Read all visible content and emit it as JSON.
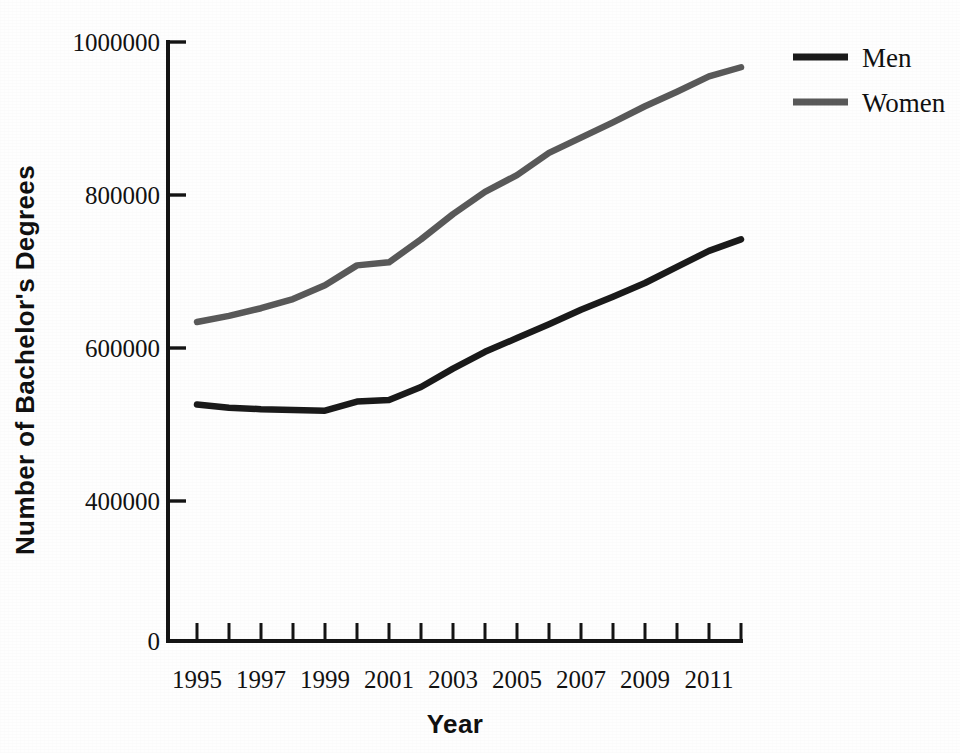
{
  "chart_data": {
    "type": "line",
    "title": "",
    "xlabel": "Year",
    "ylabel": "Number of Bachelor's Degrees",
    "x": [
      1995,
      1996,
      1997,
      1998,
      1999,
      2000,
      2001,
      2002,
      2003,
      2004,
      2005,
      2006,
      2007,
      2008,
      2009,
      2010,
      2011,
      2012
    ],
    "series": [
      {
        "name": "Men",
        "color": "#1a1a1a",
        "values": [
          526000,
          522000,
          520000,
          519000,
          518000,
          530000,
          532000,
          549000,
          573000,
          595000,
          613000,
          631000,
          650000,
          667000,
          685000,
          706000,
          727000,
          742000
        ]
      },
      {
        "name": "Women",
        "color": "#595959",
        "values": [
          634000,
          642000,
          652000,
          664000,
          682000,
          708000,
          712000,
          742000,
          775000,
          804000,
          826000,
          855000,
          875000,
          895000,
          916000,
          935000,
          955000,
          967000
        ]
      }
    ],
    "xlim": [
      1995,
      2012
    ],
    "ylim": [
      0,
      1000000
    ],
    "y_axis_break": true,
    "y_axis_note": "Axis is compressed between 0 and 400000 (no 200000 tick shown)",
    "yticks": [
      0,
      400000,
      600000,
      800000,
      1000000
    ],
    "ytick_labels": [
      "0",
      "400000",
      "600000",
      "800000",
      "1000000"
    ],
    "xticks": [
      1995,
      1996,
      1997,
      1998,
      1999,
      2000,
      2001,
      2002,
      2003,
      2004,
      2005,
      2006,
      2007,
      2008,
      2009,
      2010,
      2011,
      2012
    ],
    "xtick_labels_shown": [
      "1995",
      "1997",
      "1999",
      "2001",
      "2003",
      "2005",
      "2007",
      "2009",
      "2011"
    ],
    "grid": false,
    "legend_position": "top-right",
    "legend_entries": [
      "Men",
      "Women"
    ],
    "background_color": "#fefefe",
    "axis_color": "#141414"
  },
  "axes": {
    "y_title": "Number of Bachelor's Degrees",
    "x_title": "Year",
    "y_tick_0": "0",
    "y_tick_400k": "400000",
    "y_tick_600k": "600000",
    "y_tick_800k": "800000",
    "y_tick_1000k": "1000000",
    "x_tick_1995": "1995",
    "x_tick_1997": "1997",
    "x_tick_1999": "1999",
    "x_tick_2001": "2001",
    "x_tick_2003": "2003",
    "x_tick_2005": "2005",
    "x_tick_2007": "2007",
    "x_tick_2009": "2009",
    "x_tick_2011": "2011"
  },
  "legend": {
    "men_label": "Men",
    "women_label": "Women",
    "men_color": "#1a1a1a",
    "women_color": "#595959"
  }
}
